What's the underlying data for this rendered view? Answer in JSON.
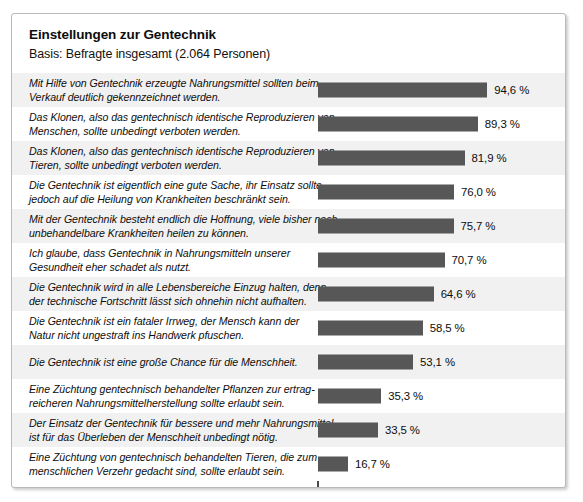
{
  "chart": {
    "title": "Einstellungen zur Gentechnik",
    "subtitle": "Basis: Befragte insgesamt (2.064 Personen)"
  },
  "chart_data": {
    "type": "bar",
    "orientation": "horizontal",
    "title": "Einstellungen zur Gentechnik",
    "subtitle": "Basis: Befragte insgesamt (2.064 Personen)",
    "xlabel": "",
    "ylabel": "",
    "xlim": [
      0,
      100
    ],
    "grid": false,
    "legend": "none",
    "value_suffix": "%",
    "decimal_separator": ",",
    "bar_color": "#575757",
    "band_color": "#f1f1f1",
    "categories": [
      "Mit Hilfe von Gentechnik erzeugte Nahrungsmittel sollten beim Verkauf deutlich gekennzeichnet werden.",
      "Das Klonen, also das gentechnisch identische Reproduzieren von Menschen, sollte unbedingt verboten werden.",
      "Das Klonen, also das gentechnisch identische Reproduzieren von Tieren, sollte unbedingt verboten werden.",
      "Die Gentechnik ist eigentlich eine gute Sache, ihr Einsatz sollte jedoch auf die Heilung von Krankheiten beschränkt sein.",
      "Mit der Gentechnik besteht endlich die Hoffnung, viele bisher noch unbehandelbare Krankheiten heilen zu können.",
      "Ich glaube, dass Gentechnik in Nahrungsmitteln unserer Gesundheit eher schadet als nutzt.",
      "Die Gentechnik wird in alle Lebensbereiche Einzug halten, denn der technische Fortschritt lässt sich ohnehin nicht aufhalten.",
      "Die Gentechnik ist ein fataler Irrweg, der Mensch kann der Natur nicht ungestraft ins Handwerk pfuschen.",
      "Die Gentechnik ist eine große Chance für die Menschheit.",
      "Eine Züchtung gentechnisch behandelter Pflanzen zur ertrag-reicheren Nahrungsmittelherstellung sollte erlaubt sein.",
      "Der Einsatz der Gentechnik für bessere und mehr Nahrungsmittel ist für das Überleben der Menschheit unbedingt nötig.",
      "Eine Züchtung von gentechnisch behandelten Tieren, die zum menschlichen Verzehr gedacht sind, sollte erlaubt sein."
    ],
    "values": [
      94.6,
      89.3,
      81.9,
      76.0,
      75.7,
      70.7,
      64.6,
      58.5,
      53.1,
      35.3,
      33.5,
      16.7
    ],
    "value_labels": [
      "94,6 %",
      "89,3 %",
      "81,9 %",
      "76,0 %",
      "75,7 %",
      "70,7 %",
      "64,6 %",
      "58,5 %",
      "53,1 %",
      "35,3 %",
      "33,5 %",
      "16,7 %"
    ]
  },
  "rows": [
    {
      "lines": [
        "Mit Hilfe von Gentechnik erzeugte Nahrungsmittel sollten beim",
        "Verkauf deutlich gekennzeichnet werden."
      ],
      "value_label": "94,6 %",
      "value": 94.6
    },
    {
      "lines": [
        "Das Klonen, also das gentechnisch identische Reproduzieren von",
        "Menschen, sollte unbedingt verboten werden."
      ],
      "value_label": "89,3 %",
      "value": 89.3
    },
    {
      "lines": [
        "Das Klonen, also das gentechnisch identische Reproduzieren von",
        "Tieren, sollte unbedingt verboten werden."
      ],
      "value_label": "81,9 %",
      "value": 81.9
    },
    {
      "lines": [
        "Die Gentechnik ist eigentlich eine gute Sache, ihr Einsatz sollte",
        "jedoch auf die Heilung von Krankheiten beschränkt sein."
      ],
      "value_label": "76,0 %",
      "value": 76.0
    },
    {
      "lines": [
        "Mit der Gentechnik besteht endlich die Hoffnung, viele bisher noch",
        "unbehandelbare Krankheiten heilen zu können."
      ],
      "value_label": "75,7 %",
      "value": 75.7
    },
    {
      "lines": [
        "Ich glaube, dass Gentechnik in Nahrungsmitteln unserer",
        "Gesundheit eher schadet als nutzt."
      ],
      "value_label": "70,7 %",
      "value": 70.7
    },
    {
      "lines": [
        "Die Gentechnik wird in alle Lebensbereiche Einzug halten, denn",
        "der technische Fortschritt lässt sich ohnehin nicht aufhalten."
      ],
      "value_label": "64,6 %",
      "value": 64.6
    },
    {
      "lines": [
        "Die Gentechnik ist ein fataler Irrweg, der Mensch kann der",
        "Natur nicht ungestraft ins Handwerk pfuschen."
      ],
      "value_label": "58,5 %",
      "value": 58.5
    },
    {
      "lines": [
        "Die Gentechnik ist eine große Chance für die Menschheit."
      ],
      "value_label": "53,1 %",
      "value": 53.1
    },
    {
      "lines": [
        "Eine Züchtung gentechnisch behandelter Pflanzen zur ertrag-",
        "reicheren Nahrungsmittelherstellung sollte erlaubt sein."
      ],
      "value_label": "35,3 %",
      "value": 35.3
    },
    {
      "lines": [
        "Der Einsatz der Gentechnik für bessere und mehr Nahrungsmittel",
        "ist für das Überleben der Menschheit unbedingt nötig."
      ],
      "value_label": "33,5 %",
      "value": 33.5
    },
    {
      "lines": [
        "Eine Züchtung von gentechnisch behandelten Tieren, die zum",
        "menschlichen Verzehr gedacht sind, sollte erlaubt sein."
      ],
      "value_label": "16,7 %",
      "value": 16.7
    }
  ]
}
